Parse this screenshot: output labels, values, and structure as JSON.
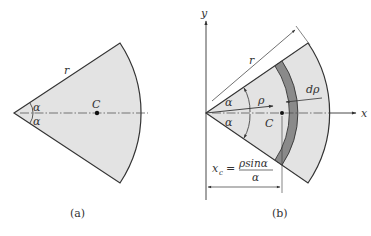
{
  "figure_a": {
    "caption": "(a)",
    "labels": {
      "radius": "r",
      "angle_top": "α",
      "angle_bottom": "α",
      "centroid": "C"
    }
  },
  "figure_b": {
    "caption": "(b)",
    "labels": {
      "y_axis": "y",
      "x_axis": "x",
      "radius": "r",
      "rho": "ρ",
      "d_rho": "dρ",
      "angle_top": "α",
      "angle_bottom": "α",
      "centroid": "C",
      "xc_lhs": "x",
      "xc_sub": "c",
      "xc_eq": "=",
      "xc_num": "ρsinα",
      "xc_den": "α"
    }
  },
  "colors": {
    "sector_fill": "#e3e3e3",
    "strip_fill": "#8a8a8a",
    "stroke": "#333333"
  }
}
